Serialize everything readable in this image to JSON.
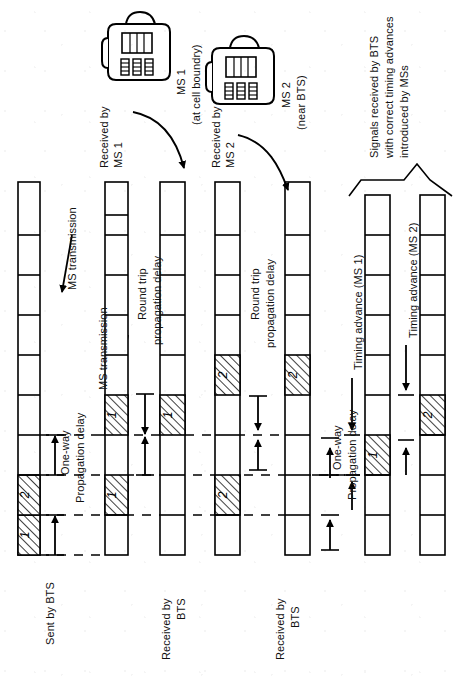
{
  "figure": {
    "type": "timing-diagram"
  },
  "devices": [
    {
      "id": "ms1",
      "icon": "mobile-handset-icon",
      "name": "MS 1",
      "qualifier": "(at cell boundry)",
      "received_label_line1": "Received by",
      "received_label_line2": "MS 1"
    },
    {
      "id": "ms2",
      "icon": "mobile-handset-icon",
      "name": "MS 2",
      "qualifier": "(near BTS)",
      "received_label_line1": "Received by",
      "received_label_line2": "MS 2"
    }
  ],
  "columns": [
    {
      "id": "sent-by-bts",
      "label_lines": [
        "Sent by BTS"
      ],
      "slots": [
        {
          "index": 0,
          "fill": "hatch",
          "text": "1"
        },
        {
          "index": 1,
          "fill": "hatch",
          "text": "2"
        },
        {
          "index": 2,
          "fill": "empty",
          "text": ""
        },
        {
          "index": 3,
          "fill": "empty",
          "text": ""
        },
        {
          "index": 4,
          "fill": "empty",
          "text": ""
        },
        {
          "index": 5,
          "fill": "empty",
          "text": ""
        },
        {
          "index": 6,
          "fill": "empty",
          "text": ""
        },
        {
          "index": 7,
          "fill": "empty",
          "text": ""
        },
        {
          "index": 8,
          "fill": "empty",
          "text": ""
        }
      ]
    },
    {
      "id": "received-by-ms1",
      "label_lines": [
        "Received by",
        "MS 1"
      ],
      "slots": [
        {
          "index": 0,
          "fill": "empty",
          "text": ""
        },
        {
          "index": 1,
          "fill": "hatch",
          "text": "1"
        },
        {
          "index": 2,
          "fill": "empty",
          "text": ""
        },
        {
          "index": 3,
          "fill": "empty",
          "text": ""
        },
        {
          "index": 4,
          "fill": "hatch",
          "text": "1"
        },
        {
          "index": 5,
          "fill": "empty",
          "text": ""
        },
        {
          "index": 6,
          "fill": "empty",
          "text": ""
        },
        {
          "index": 7,
          "fill": "empty",
          "text": ""
        },
        {
          "index": 8,
          "fill": "empty",
          "text": ""
        }
      ]
    },
    {
      "id": "received-by-bts-1",
      "label_lines": [
        "Received by",
        "BTS"
      ],
      "slots": [
        {
          "index": 0,
          "fill": "empty",
          "text": ""
        },
        {
          "index": 1,
          "fill": "empty",
          "text": ""
        },
        {
          "index": 2,
          "fill": "empty",
          "text": ""
        },
        {
          "index": 3,
          "fill": "hatch",
          "text": "1"
        },
        {
          "index": 4,
          "fill": "empty",
          "text": ""
        },
        {
          "index": 5,
          "fill": "empty",
          "text": ""
        },
        {
          "index": 6,
          "fill": "empty",
          "text": ""
        },
        {
          "index": 7,
          "fill": "empty",
          "text": ""
        },
        {
          "index": 8,
          "fill": "empty",
          "text": ""
        }
      ]
    },
    {
      "id": "received-by-ms2",
      "label_lines": [
        "Received by",
        "MS 2"
      ],
      "slots": [
        {
          "index": 0,
          "fill": "empty",
          "text": ""
        },
        {
          "index": 1,
          "fill": "hatch",
          "text": "2"
        },
        {
          "index": 2,
          "fill": "empty",
          "text": ""
        },
        {
          "index": 3,
          "fill": "empty",
          "text": ""
        },
        {
          "index": 4,
          "fill": "hatch",
          "text": "2"
        },
        {
          "index": 5,
          "fill": "empty",
          "text": ""
        },
        {
          "index": 6,
          "fill": "empty",
          "text": ""
        },
        {
          "index": 7,
          "fill": "empty",
          "text": ""
        },
        {
          "index": 8,
          "fill": "empty",
          "text": ""
        }
      ]
    },
    {
      "id": "received-by-bts-2",
      "label_lines": [
        "Received by",
        "BTS"
      ],
      "slots": [
        {
          "index": 0,
          "fill": "empty",
          "text": ""
        },
        {
          "index": 1,
          "fill": "empty",
          "text": ""
        },
        {
          "index": 2,
          "fill": "hatch",
          "text": "2"
        },
        {
          "index": 3,
          "fill": "empty",
          "text": ""
        },
        {
          "index": 4,
          "fill": "empty",
          "text": ""
        },
        {
          "index": 5,
          "fill": "empty",
          "text": ""
        },
        {
          "index": 6,
          "fill": "empty",
          "text": ""
        },
        {
          "index": 7,
          "fill": "empty",
          "text": ""
        },
        {
          "index": 8,
          "fill": "empty",
          "text": ""
        }
      ]
    },
    {
      "id": "corrected-ms1",
      "label_lines": [],
      "slots": [
        {
          "index": 0,
          "fill": "empty",
          "text": ""
        },
        {
          "index": 1,
          "fill": "empty",
          "text": ""
        },
        {
          "index": 2,
          "fill": "empty",
          "text": ""
        },
        {
          "index": 3,
          "fill": "empty",
          "text": ""
        },
        {
          "index": 4,
          "fill": "hatch",
          "text": "1"
        },
        {
          "index": 5,
          "fill": "empty",
          "text": ""
        },
        {
          "index": 6,
          "fill": "empty",
          "text": ""
        },
        {
          "index": 7,
          "fill": "empty",
          "text": ""
        },
        {
          "index": 8,
          "fill": "empty",
          "text": ""
        }
      ]
    },
    {
      "id": "corrected-ms2",
      "label_lines": [],
      "slots": [
        {
          "index": 0,
          "fill": "empty",
          "text": ""
        },
        {
          "index": 1,
          "fill": "empty",
          "text": ""
        },
        {
          "index": 2,
          "fill": "empty",
          "text": ""
        },
        {
          "index": 3,
          "fill": "hatch",
          "text": "2"
        },
        {
          "index": 4,
          "fill": "empty",
          "text": ""
        },
        {
          "index": 5,
          "fill": "empty",
          "text": ""
        },
        {
          "index": 6,
          "fill": "empty",
          "text": ""
        },
        {
          "index": 7,
          "fill": "empty",
          "text": ""
        },
        {
          "index": 8,
          "fill": "empty",
          "text": ""
        }
      ]
    }
  ],
  "annotations": {
    "ms_transmission_1": "MS transmission",
    "ms_transmission_2": "MS transmission",
    "one_way_a_line1": "One-way",
    "one_way_a_line2": "Propagation delay",
    "one_way_b_line1": "One-way",
    "one_way_b_line2": "Propagation delay",
    "round_trip_1_line1": "Round trip",
    "round_trip_1_line2": "propagation delay",
    "round_trip_2_line1": "Round trip",
    "round_trip_2_line2": "propagation delay",
    "timing_advance_ms1": "Timing advance (MS 1)",
    "timing_advance_ms2": "Timing advance (MS 2)",
    "bracket_note_line1": "Signals received by BTS",
    "bracket_note_line2": "with correct timing advances",
    "bracket_note_line3": "introduced by MSs"
  }
}
